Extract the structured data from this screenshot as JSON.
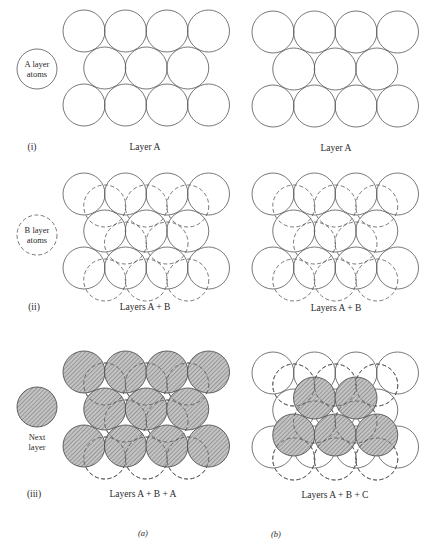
{
  "figure": {
    "type": "close-packing-diagram",
    "columns": [
      {
        "label": "(a)",
        "description": "hexagonal close packing ABA"
      },
      {
        "label": "(b)",
        "description": "cubic close packing ABC"
      }
    ],
    "rows": [
      {
        "label": "(i)",
        "caption_a": "Layer A",
        "caption_b": "Layer A"
      },
      {
        "label": "(ii)",
        "caption_a": "Layers A + B",
        "caption_b": "Layers A + B"
      },
      {
        "label": "(iii)",
        "caption_a": "Layers A + B + A",
        "caption_b": "Layers A + B + C"
      }
    ],
    "legend": {
      "a_layer": {
        "line1": "A layer",
        "line2": "atoms",
        "style": "solid"
      },
      "b_layer": {
        "line1": "B layer",
        "line2": "atoms",
        "style": "dashed"
      },
      "next_layer": {
        "line1": "Next",
        "line2": "layer",
        "style": "hatched"
      }
    },
    "colors": {
      "stroke": "#555555",
      "hatch_fill": "#bdbdbd",
      "hatch_line": "#6a6a6a",
      "background": "#ffffff"
    }
  }
}
